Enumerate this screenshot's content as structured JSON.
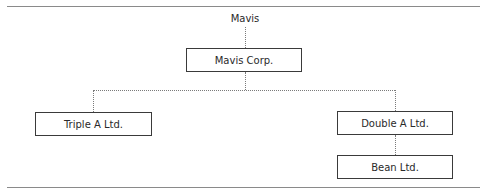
{
  "diagram": {
    "type": "org-chart",
    "root_label": "Mavis",
    "nodes": [
      {
        "id": "mavis-corp",
        "label": "Mavis Corp.",
        "parent": "Mavis"
      },
      {
        "id": "triple-a",
        "label": "Triple A Ltd.",
        "parent": "mavis-corp"
      },
      {
        "id": "double-a",
        "label": "Double A Ltd.",
        "parent": "mavis-corp"
      },
      {
        "id": "bean",
        "label": "Bean Ltd.",
        "parent": "double-a"
      }
    ]
  }
}
